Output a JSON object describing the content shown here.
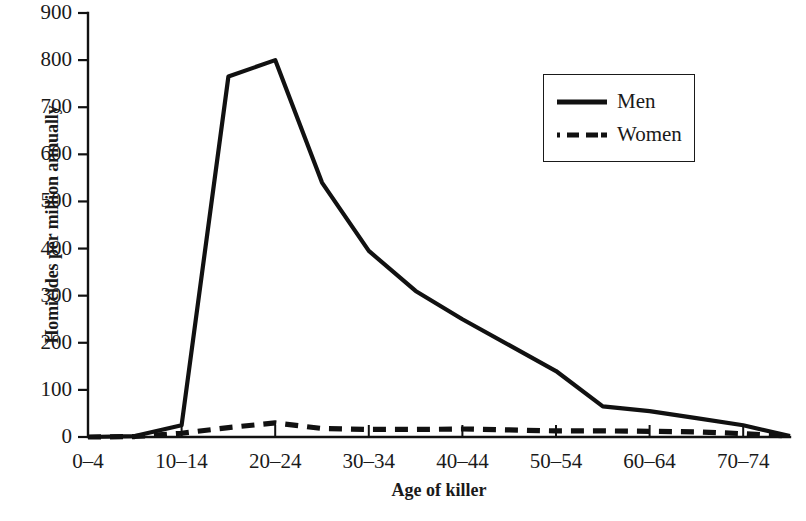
{
  "chart_data": {
    "type": "line",
    "title": "",
    "xlabel": "Age of killer",
    "ylabel": "Homicides per million annually",
    "ylim": [
      0,
      900
    ],
    "ytick_labels": [
      "0",
      "100",
      "200",
      "300",
      "400",
      "500",
      "600",
      "700",
      "800",
      "900"
    ],
    "ytick_values": [
      0,
      100,
      200,
      300,
      400,
      500,
      600,
      700,
      800,
      900
    ],
    "grid": false,
    "legend_position": "upper-right",
    "categories": [
      "0–4",
      "5–9",
      "10–14",
      "15–19",
      "20–24",
      "25–29",
      "30–34",
      "35–39",
      "40–44",
      "45–49",
      "50–54",
      "55–59",
      "60–64",
      "65–69",
      "70–74",
      "75–79"
    ],
    "xtick_labels": [
      "0–4",
      "10–14",
      "20–24",
      "30–34",
      "40–44",
      "50–54",
      "60–64",
      "70–74"
    ],
    "xtick_indices": [
      0,
      2,
      4,
      6,
      8,
      10,
      12,
      14
    ],
    "series": [
      {
        "name": "Men",
        "style": "solid",
        "color": "#111111",
        "values": [
          0,
          2,
          25,
          765,
          800,
          540,
          395,
          310,
          250,
          195,
          140,
          65,
          55,
          40,
          25,
          2
        ]
      },
      {
        "name": "Women",
        "style": "dashed",
        "color": "#111111",
        "values": [
          0,
          1,
          8,
          20,
          30,
          18,
          16,
          16,
          17,
          15,
          13,
          13,
          12,
          11,
          7,
          2
        ]
      }
    ]
  },
  "legend": {
    "items": [
      {
        "label": "Men"
      },
      {
        "label": "Women"
      }
    ]
  },
  "axes": {
    "y_title": "Homicides per million annually",
    "x_title": "Age of killer"
  },
  "colors": {
    "ink": "#111111",
    "background": "#ffffff"
  }
}
